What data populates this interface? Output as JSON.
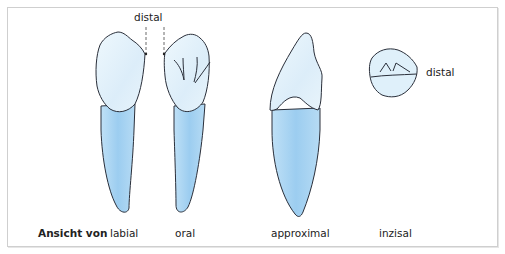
{
  "figure": {
    "annotations": {
      "distal_top": "distal",
      "distal_right": "distal"
    },
    "caption": {
      "prefix": "Ansicht von",
      "views": [
        "labial",
        "oral",
        "approximal",
        "inzisal"
      ]
    },
    "colors": {
      "crown_fill": "#e4f2fb",
      "root_fill": "#a9d5f2",
      "outline": "#2a2f3a",
      "frame_border": "#cfcfcf"
    }
  }
}
